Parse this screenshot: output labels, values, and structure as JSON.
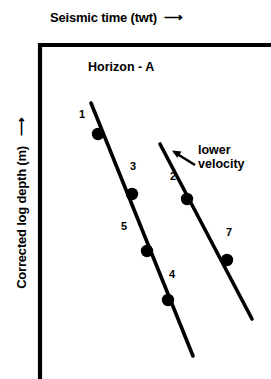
{
  "figure": {
    "background_color": "#ffffff",
    "ink_color": "#000000",
    "width": 271,
    "height": 379
  },
  "axes": {
    "x_title": "Seismic time (twt)",
    "x_arrow": "right-arrow",
    "y_title": "Corrected log depth (m)",
    "y_arrow": "down-arrow",
    "frame": "open-L-shape-top-and-left"
  },
  "plot_title": "Horizon - A",
  "annotation": {
    "line1": "lower",
    "line2": "velocity",
    "pointer": "arrow-down-left"
  },
  "chart_data": {
    "type": "scatter",
    "title": "Horizon - A",
    "xlabel": "Seismic time (twt)",
    "ylabel": "Corrected log depth (m)",
    "grid": false,
    "legend": null,
    "xlim": [
      39,
      271
    ],
    "ylim": [
      44,
      379
    ],
    "annotations": [
      "Horizon - A",
      "lower velocity"
    ],
    "series": [
      {
        "name": "trend-line-left",
        "type": "line",
        "x": [
          91,
          193
        ],
        "y": [
          103,
          356
        ]
      },
      {
        "name": "trend-line-right",
        "type": "line",
        "x": [
          160,
          252
        ],
        "y": [
          144,
          319
        ]
      },
      {
        "name": "wells-left-trend",
        "type": "scatter",
        "points": [
          {
            "label": "1",
            "x": 98,
            "y": 134,
            "label_x": 82,
            "label_y": 118
          },
          {
            "label": "3",
            "x": 132,
            "y": 194,
            "label_x": 133,
            "label_y": 170
          },
          {
            "label": "5",
            "x": 147,
            "y": 251,
            "label_x": 124,
            "label_y": 230
          },
          {
            "label": "4",
            "x": 168,
            "y": 300,
            "label_x": 172,
            "label_y": 278
          }
        ]
      },
      {
        "name": "wells-right-trend",
        "type": "scatter",
        "points": [
          {
            "label": "2",
            "x": 187,
            "y": 199,
            "label_x": 173,
            "label_y": 180
          },
          {
            "label": "7",
            "x": 227,
            "y": 260,
            "label_x": 229,
            "label_y": 236
          }
        ]
      }
    ]
  }
}
